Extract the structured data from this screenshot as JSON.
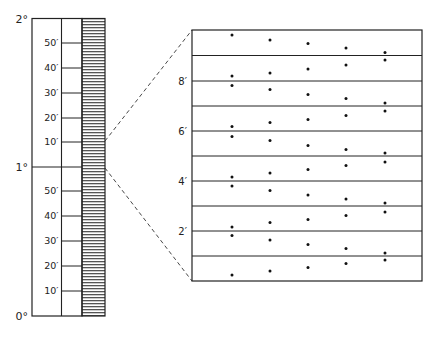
{
  "diagram": {
    "ruler": {
      "x_left": 32,
      "x_divider": 61.5,
      "x_hatch_left": 82,
      "x_hatch_right": 105,
      "y_top": 18.5,
      "y_bottom": 316,
      "degree_labels": [
        {
          "text": "2°",
          "y": 18.5
        },
        {
          "text": "1°",
          "y": 167
        },
        {
          "text": "0°",
          "y": 316
        }
      ],
      "minute_labels": [
        {
          "text": "50′",
          "y": 43
        },
        {
          "text": "40′",
          "y": 68
        },
        {
          "text": "30′",
          "y": 93
        },
        {
          "text": "20′",
          "y": 118
        },
        {
          "text": "10′",
          "y": 142
        },
        {
          "text": "50′",
          "y": 191
        },
        {
          "text": "40′",
          "y": 216
        },
        {
          "text": "30′",
          "y": 241
        },
        {
          "text": "20′",
          "y": 266
        },
        {
          "text": "10′",
          "y": 291
        }
      ]
    },
    "magnified": {
      "x_left": 192,
      "x_right": 422,
      "y_top": 30,
      "y_bottom": 281,
      "line_ys": [
        55.5,
        81,
        106,
        131,
        156,
        181,
        206,
        231,
        256
      ],
      "labels": [
        {
          "text": "8′",
          "y": 81
        },
        {
          "text": "6′",
          "y": 131
        },
        {
          "text": "4′",
          "y": 181
        },
        {
          "text": "2′",
          "y": 231
        }
      ],
      "dot_xs": [
        232,
        270,
        308,
        346,
        385
      ],
      "dot_rows": [
        [
          35,
          40,
          43.5,
          48,
          52.5
        ],
        [
          76,
          73,
          69,
          65,
          60
        ],
        [
          85.5,
          89.5,
          94.5,
          98.5,
          103
        ],
        [
          126.5,
          122.5,
          119.5,
          115.5,
          111
        ],
        [
          136.5,
          140.5,
          145.5,
          149.5,
          153
        ],
        [
          177,
          173,
          169.5,
          165.5,
          162
        ],
        [
          186,
          190.5,
          195,
          199,
          203
        ],
        [
          227,
          222.5,
          219.5,
          215.5,
          212
        ],
        [
          235.5,
          240,
          244.5,
          248.5,
          253
        ],
        [
          275,
          271,
          267.5,
          263.5,
          260
        ]
      ]
    },
    "connectors": [
      {
        "from": [
          105,
          141
        ],
        "to": [
          192,
          30
        ]
      },
      {
        "from": [
          105,
          168
        ],
        "to": [
          192,
          281
        ]
      }
    ]
  }
}
